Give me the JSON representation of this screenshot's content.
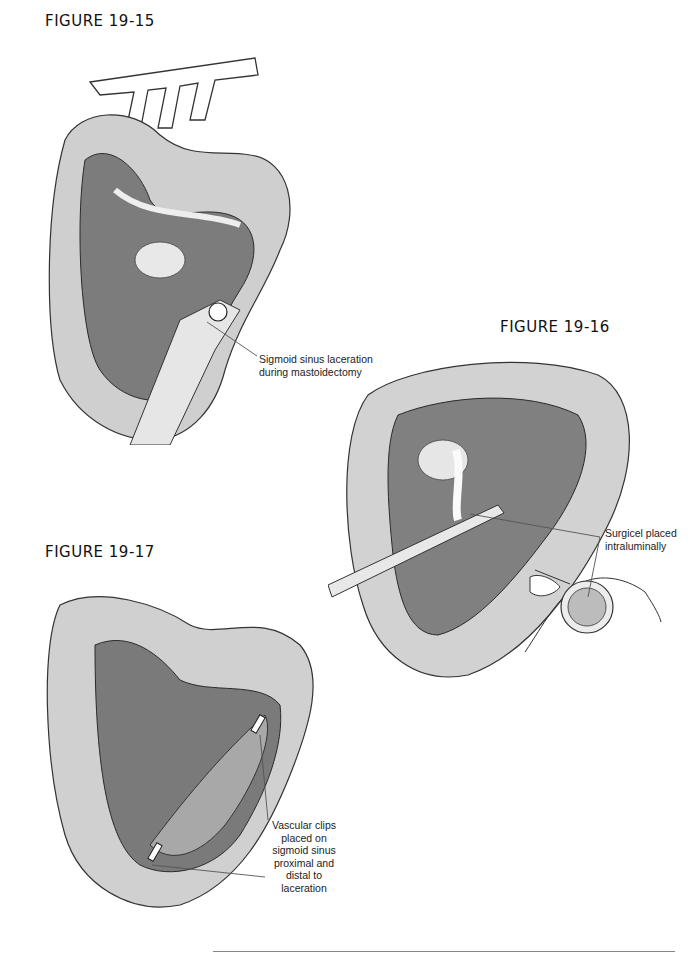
{
  "page": {
    "figures": [
      {
        "id": "fig-19-15",
        "label": "FIGURE 19-15",
        "callouts": [
          {
            "lines": [
              "Sigmoid sinus laceration",
              "during mastoidectomy"
            ]
          }
        ]
      },
      {
        "id": "fig-19-16",
        "label": "FIGURE 19-16",
        "callouts": [
          {
            "lines": [
              "Surgicel placed",
              "intraluminally"
            ]
          }
        ]
      },
      {
        "id": "fig-19-17",
        "label": "FIGURE 19-17",
        "callouts": [
          {
            "lines": [
              "Vascular clips",
              "placed on",
              "sigmoid sinus",
              "proximal and",
              "distal to",
              "laceration"
            ]
          }
        ]
      }
    ],
    "colors": {
      "ink": "#1a1a1a",
      "shade_dark": "#3a3a3a",
      "shade_mid": "#8a8a8a",
      "shade_light": "#d6d6d6",
      "rule": "#888888"
    }
  }
}
